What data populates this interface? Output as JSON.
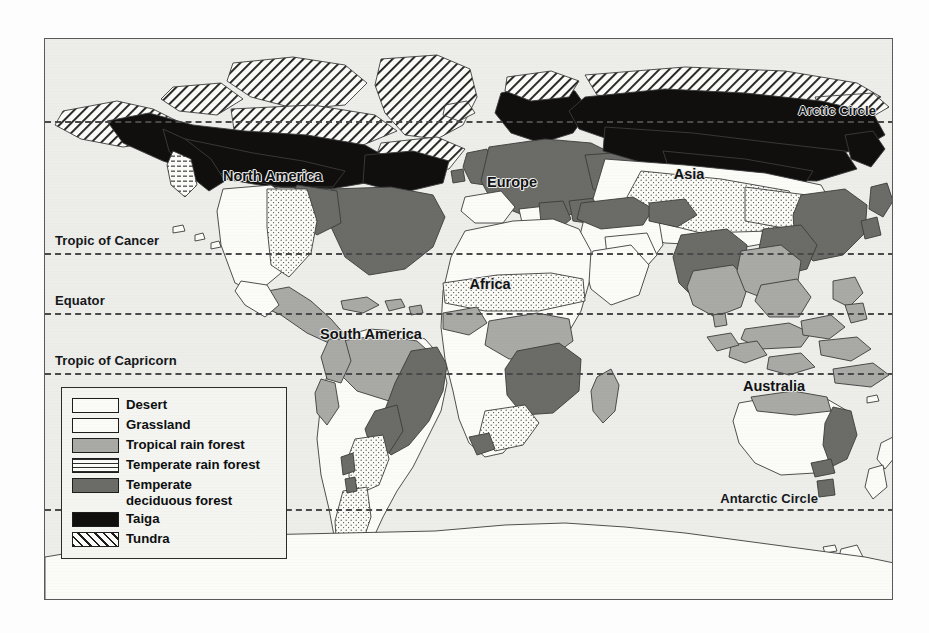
{
  "map": {
    "title": "World Biomes",
    "background_color": "#ededea",
    "frame_color": "#5a5a5a",
    "latitude_lines": [
      {
        "name": "arctic-circle",
        "label": "Arctic Circle",
        "align": "right"
      },
      {
        "name": "tropic-of-cancer",
        "label": "Tropic of Cancer",
        "align": "left"
      },
      {
        "name": "equator",
        "label": "Equator",
        "align": "left"
      },
      {
        "name": "tropic-of-capricorn",
        "label": "Tropic of Capricorn",
        "align": "left"
      },
      {
        "name": "antarctic-circle",
        "label": "Antarctic Circle",
        "align": "right"
      }
    ],
    "continents": [
      {
        "name": "north-america",
        "label": "North\nAmerica"
      },
      {
        "name": "south-america",
        "label": "South\nAmerica"
      },
      {
        "name": "europe",
        "label": "Europe"
      },
      {
        "name": "africa",
        "label": "Africa"
      },
      {
        "name": "asia",
        "label": "Asia"
      },
      {
        "name": "australia",
        "label": "Australia"
      }
    ]
  },
  "legend": {
    "items": [
      {
        "key": "desert",
        "label": "Desert",
        "color": "#fbfbf8",
        "pattern": "solid-white"
      },
      {
        "key": "grassland",
        "label": "Grassland",
        "color": "#fbfbf8",
        "pattern": "stipple-dots"
      },
      {
        "key": "tropical-rain-forest",
        "label": "Tropical rain forest",
        "color": "#a9a9a6",
        "pattern": "solid-gray"
      },
      {
        "key": "temperate-rain-forest",
        "label": "Temperate rain forest",
        "color": "#fbfbf8",
        "pattern": "horizontal-dashes"
      },
      {
        "key": "temperate-deciduous-forest",
        "label": "Temperate\ndeciduous forest",
        "color": "#6b6b68",
        "pattern": "solid-dark-gray"
      },
      {
        "key": "taiga",
        "label": "Taiga",
        "color": "#100f0e",
        "pattern": "solid-black"
      },
      {
        "key": "tundra",
        "label": "Tundra",
        "color": "#fbfbf8",
        "pattern": "diagonal-hatch"
      }
    ]
  }
}
